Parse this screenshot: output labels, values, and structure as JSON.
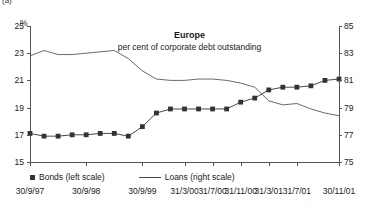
{
  "panel_tag": "(a)",
  "axis_unit": "%",
  "title": "Europe",
  "subtitle": "per cent of corporate debt outstanding",
  "legend": {
    "bonds": "Bonds (left scale)",
    "loans": "Loans (right scale)"
  },
  "colors": {
    "bonds": "#333333",
    "loans": "#444444",
    "axis": "#555555"
  },
  "chart_data": {
    "type": "line",
    "title": "Europe",
    "subtitle": "per cent of corporate debt outstanding",
    "xlabel": "",
    "ylabel": "%",
    "grid": false,
    "legend_position": "bottom-left",
    "left_axis": {
      "label": "%",
      "ylim": [
        15,
        25
      ],
      "ticks": [
        15,
        17,
        19,
        21,
        23,
        25
      ],
      "tick_labels": [
        "15",
        "17",
        "19",
        "21",
        "23",
        "25"
      ]
    },
    "right_axis": {
      "ylim": [
        75,
        85
      ],
      "ticks": [
        75,
        77,
        79,
        81,
        83,
        85
      ],
      "tick_labels": [
        "75",
        "77",
        "79",
        "81",
        "83",
        "85"
      ]
    },
    "x_tick_labels": [
      "30/9/97",
      "30/9/98",
      "30/9/99",
      "31/3/00",
      "31/7/00",
      "31/11/00",
      "31/3/01",
      "31/7/01",
      "30/11/01"
    ],
    "x_tick_positions": [
      0,
      4,
      8,
      11,
      13,
      15,
      17,
      19,
      22
    ],
    "n_points": 23,
    "series": [
      {
        "name": "Bonds (left scale)",
        "axis": "left",
        "marker": "square",
        "values": [
          17.1,
          16.9,
          16.9,
          17.0,
          17.0,
          17.1,
          17.1,
          16.9,
          17.6,
          18.6,
          18.9,
          18.9,
          18.9,
          18.9,
          18.9,
          19.4,
          19.7,
          20.3,
          20.5,
          20.5,
          20.6,
          21.0,
          21.1
        ]
      },
      {
        "name": "Loans (right scale)",
        "axis": "right",
        "marker": "none",
        "values": [
          82.8,
          83.2,
          82.9,
          82.9,
          83.0,
          83.1,
          83.2,
          82.6,
          81.7,
          81.1,
          81.0,
          81.0,
          81.1,
          81.1,
          81.0,
          80.8,
          80.5,
          79.5,
          79.2,
          79.3,
          78.9,
          78.6,
          78.4
        ]
      }
    ]
  }
}
